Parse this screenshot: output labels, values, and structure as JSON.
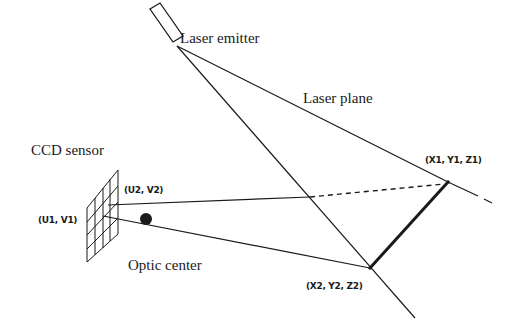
{
  "diagram": {
    "labels": {
      "laser_emitter": "Laser emitter",
      "laser_plane": "Laser plane",
      "ccd_sensor": "CCD sensor",
      "optic_center": "Optic center",
      "u2v2": "(U2, V2)",
      "u1v1": "(U1, V1)",
      "x1y1z1": "(X1, Y1, Z1)",
      "x2y2z2": "(X2, Y2, Z2)"
    },
    "colors": {
      "ink": "#1a1a1a",
      "background": "#ffffff"
    }
  }
}
